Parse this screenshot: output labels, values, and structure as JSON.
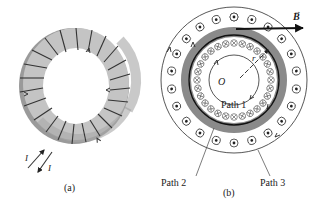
{
  "figure_a": {
    "caption": "(a)",
    "current_label_in": "I",
    "current_label_out": "I",
    "colors": {
      "toroid_light": "#c8c8c8",
      "toroid_dark": "#8e8e8e",
      "winding": "#333333"
    }
  },
  "figure_b": {
    "caption": "(b)",
    "field_label": "B",
    "center_label": "O",
    "radius_label": "r",
    "path1_label": "Path 1",
    "path2_label": "Path 2",
    "path3_label": "Path 3",
    "inner_symbol": "into-page (⊗)",
    "outer_symbol": "out-of-page (⊙)",
    "colors": {
      "core_ring": "#8a8a8a",
      "path_line": "#111111",
      "thin_line": "#444444"
    }
  }
}
